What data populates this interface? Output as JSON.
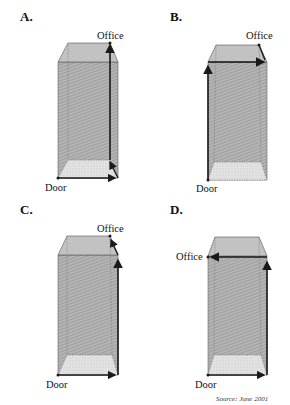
{
  "panels": [
    {
      "id": "A",
      "label": "A.",
      "start": "Door",
      "end": "Office"
    },
    {
      "id": "B",
      "label": "B.",
      "start": "Door",
      "end": "Office"
    },
    {
      "id": "C",
      "label": "C.",
      "start": "Door",
      "end": "Office"
    },
    {
      "id": "D",
      "label": "D.",
      "start": "Door",
      "end": "Office"
    }
  ],
  "source": "Source: June 2001",
  "colors": {
    "box_fill": "#a9a9a9",
    "floor_fill": "#dcdcdc",
    "top_fill": "#bdbdbd",
    "edge": "#555555",
    "arrow": "#1a1a1a"
  }
}
